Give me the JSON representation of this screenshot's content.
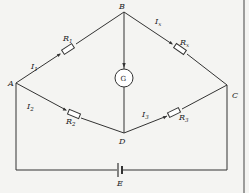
{
  "diagram": {
    "type": "Wheatstone bridge circuit",
    "nodes": {
      "A": "A",
      "B": "B",
      "C": "C",
      "D": "D",
      "E": "E"
    },
    "components": {
      "R1": {
        "name": "R",
        "sub": "1"
      },
      "Rx": {
        "name": "R",
        "sub": "x"
      },
      "R2": {
        "name": "R",
        "sub": "2"
      },
      "R3": {
        "name": "R",
        "sub": "3"
      },
      "galvanometer": "G"
    },
    "currents": {
      "I1": {
        "name": "I",
        "sub": "1"
      },
      "Ix": {
        "name": "I",
        "sub": "x"
      },
      "I2": {
        "name": "I",
        "sub": "2"
      },
      "I3": {
        "name": "I",
        "sub": "3"
      }
    }
  }
}
